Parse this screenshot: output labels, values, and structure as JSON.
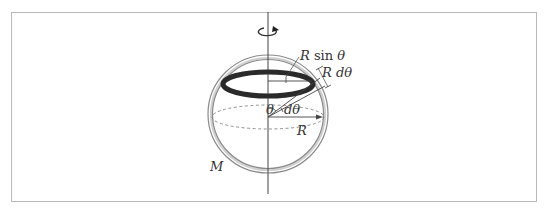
{
  "diagram": {
    "labels": {
      "r_sin_theta_R": "R",
      "r_sin_theta_fn": " sin ",
      "r_sin_theta_theta": "θ",
      "r_dtheta_R": "R",
      "r_dtheta_d": " dθ",
      "theta": "θ",
      "dtheta": "dθ",
      "radius": "R",
      "mass": "M"
    },
    "colors": {
      "frame": "#b8b8b8",
      "shell": "#888888",
      "shell_fill": "#d9d9d9",
      "ring": "#2a2a2a",
      "lines": "#444444"
    }
  }
}
